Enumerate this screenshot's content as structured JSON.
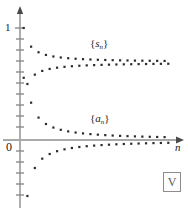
{
  "figure": {
    "name": "alternating-series-convergence-plot",
    "background_color": "#ffffff",
    "axis_color": "#8c8c8c",
    "point_color": "#2b2b2b"
  },
  "axes": {
    "y_label_top": "1",
    "origin_label": "0",
    "x_axis_label": "n",
    "x_axis_has_arrow": true,
    "y_axis_has_arrow": true,
    "y_tick_count": 19,
    "y_tick_spacing_value": 0.1,
    "grid": false
  },
  "legend": {
    "position": "inline-annotations",
    "entries": [
      {
        "id": "sn",
        "open": "{",
        "symbol": "s",
        "subscript": "n",
        "close": "}"
      },
      {
        "id": "an",
        "open": "{",
        "symbol": "a",
        "subscript": "n",
        "close": "}"
      }
    ]
  },
  "watermark": {
    "glyph": "V",
    "boxed": true,
    "border_color": "#8c8c8c"
  },
  "chart_data": {
    "type": "scatter",
    "title": "",
    "subtitle": "",
    "xlabel": "n",
    "ylabel": "",
    "grid": false,
    "legend_position": "inline",
    "xlim": [
      0,
      41
    ],
    "ylim": [
      -0.62,
      1.12
    ],
    "yticks": [
      -0.6,
      -0.5,
      -0.4,
      -0.3,
      -0.2,
      -0.1,
      0,
      0.1,
      0.2,
      0.3,
      0.4,
      0.5,
      0.6,
      0.7,
      0.8,
      0.9,
      1.0
    ],
    "ytick_labels_shown": [
      "0",
      "1"
    ],
    "annotations": [
      {
        "text": "{s_n}",
        "x": 20,
        "y": 0.95
      },
      {
        "text": "{a_n}",
        "x": 20,
        "y": 0.22
      }
    ],
    "series": [
      {
        "name": "{s_n}",
        "description": "partial sums of the alternating harmonic series, converging to ln 2 ≈ 0.693",
        "converges_to": 0.693,
        "x": [
          1,
          2,
          3,
          4,
          5,
          6,
          7,
          8,
          9,
          10,
          11,
          12,
          13,
          14,
          15,
          16,
          17,
          18,
          19,
          20,
          21,
          22,
          23,
          24,
          25,
          26,
          27,
          28,
          29,
          30,
          31,
          32,
          33,
          34,
          35,
          36,
          37,
          38,
          39,
          40
        ],
        "values": [
          1.0,
          0.5,
          0.8333,
          0.5833,
          0.7833,
          0.6167,
          0.7595,
          0.6345,
          0.7456,
          0.6456,
          0.7365,
          0.6532,
          0.7301,
          0.6587,
          0.7254,
          0.6629,
          0.7217,
          0.6661,
          0.7187,
          0.6687,
          0.7163,
          0.6709,
          0.7144,
          0.6727,
          0.7127,
          0.6742,
          0.7112,
          0.6755,
          0.71,
          0.6766,
          0.7089,
          0.6777,
          0.708,
          0.6786,
          0.7072,
          0.6794,
          0.7064,
          0.6801,
          0.7057,
          0.6807
        ]
      },
      {
        "name": "{a_n}",
        "description": "terms of the alternating harmonic series, converging to 0",
        "converges_to": 0.0,
        "x": [
          1,
          2,
          3,
          4,
          5,
          6,
          7,
          8,
          9,
          10,
          11,
          12,
          13,
          14,
          15,
          16,
          17,
          18,
          19,
          20,
          21,
          22,
          23,
          24,
          25,
          26,
          27,
          28,
          29,
          30,
          31,
          32,
          33,
          34,
          35,
          36,
          37,
          38,
          39,
          40
        ],
        "values": [
          0.5556,
          -0.5,
          0.3333,
          -0.25,
          0.2,
          -0.1667,
          0.1429,
          -0.125,
          0.1111,
          -0.1,
          0.0909,
          -0.0833,
          0.0769,
          -0.0714,
          0.0667,
          -0.0625,
          0.0588,
          -0.0556,
          0.0526,
          -0.05,
          0.0476,
          -0.0455,
          0.0435,
          -0.0417,
          0.04,
          -0.0385,
          0.037,
          -0.0357,
          0.0345,
          -0.0333,
          0.0323,
          -0.0313,
          0.0303,
          -0.0294,
          0.0286,
          -0.0278,
          0.027,
          -0.0263,
          0.0256,
          -0.025
        ]
      }
    ]
  }
}
